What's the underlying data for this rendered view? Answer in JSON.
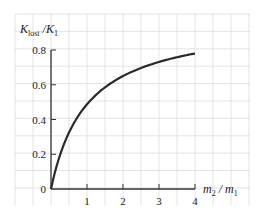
{
  "chart_data": {
    "type": "line",
    "title": "",
    "xlabel": "m2 / m1",
    "ylabel": "Klost / K1",
    "xlim": [
      0,
      4
    ],
    "ylim": [
      0,
      0.8
    ],
    "x_ticks": [
      "1",
      "2",
      "3",
      "4"
    ],
    "y_ticks": [
      "0",
      "0.2",
      "0.4",
      "0.6",
      "0.8"
    ],
    "grid": true,
    "legend": null,
    "series": [
      {
        "name": "Klost/K1",
        "x": [
          0,
          0.25,
          0.5,
          0.75,
          1,
          1.5,
          2,
          2.5,
          3,
          3.5,
          4
        ],
        "values": [
          0,
          0.2,
          0.333,
          0.429,
          0.5,
          0.6,
          0.667,
          0.714,
          0.75,
          0.778,
          0.8
        ]
      }
    ]
  },
  "labels": {
    "y_main": "K",
    "y_sub": "lost",
    "y_sep": " /K",
    "y_sub2": "1",
    "x_main": "m",
    "x_sub": "2",
    "x_sep": " / m",
    "x_sub2": "1"
  },
  "colors": {
    "grid": "#dcdcdc",
    "axis": "#333333",
    "curve": "#2a2a2a"
  }
}
